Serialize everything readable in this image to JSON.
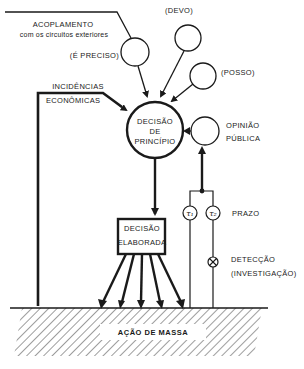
{
  "diagram": {
    "top_inputs": {
      "acoplamento_line1": "ACOPLAMENTO",
      "acoplamento_line2": "com os circuitos exteriores",
      "e_preciso": "(É PRECISO)",
      "devo": "(DEVO)",
      "posso": "(POSSO)"
    },
    "incidencias": {
      "line1": "INCIDÊNCIAS",
      "line2": "ECONÔMICAS"
    },
    "decisao_principio": {
      "line1": "DECISÃO",
      "line2": "DE",
      "line3": "PRINCÍPIO"
    },
    "opiniao_publica": {
      "line1": "OPINIÃO",
      "line2": "PÚBLICA"
    },
    "prazo": {
      "label": "PRAZO",
      "tau1": "τ₁",
      "tau2": "τ₂"
    },
    "deteccao": {
      "line1": "DETECÇÃO",
      "line2": "(INVESTIGAÇÃO)"
    },
    "decisao_elaborada": {
      "line1": "DECISÃO",
      "line2": "ELABORADA"
    },
    "acao_de_massa": "AÇÃO DE MASSA",
    "colors": {
      "ink": "#1a1a1a",
      "background": "#ffffff"
    }
  }
}
